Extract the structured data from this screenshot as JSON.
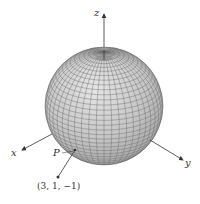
{
  "figure": {
    "type": "3d-sphere-diagram",
    "axes": {
      "x_label": "x",
      "y_label": "y",
      "z_label": "z"
    },
    "point": {
      "label": "P",
      "coordinates_label": "(3, 1, −1)"
    },
    "colors": {
      "sphere_fill": "#c8c8c8",
      "mesh": "#6a6a6a",
      "axis": "#333333"
    }
  }
}
